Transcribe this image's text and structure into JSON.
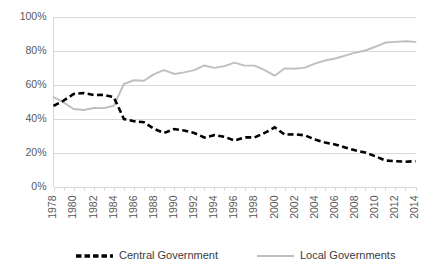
{
  "chart_data": {
    "type": "line",
    "title": "",
    "xlabel": "",
    "ylabel": "",
    "ylim": [
      0,
      100
    ],
    "xlim": [
      1978,
      2014
    ],
    "grid": true,
    "legend_position": "bottom",
    "y_ticks": [
      "0%",
      "20%",
      "40%",
      "60%",
      "80%",
      "100%"
    ],
    "y_tick_values": [
      0,
      20,
      40,
      60,
      80,
      100
    ],
    "x_tick_labels": [
      "1978",
      "1980",
      "1982",
      "1984",
      "1986",
      "1988",
      "1990",
      "1992",
      "1994",
      "1996",
      "1998",
      "2000",
      "2002",
      "2004",
      "2006",
      "2008",
      "2010",
      "2012",
      "2014"
    ],
    "x": [
      1978,
      1979,
      1980,
      1981,
      1982,
      1983,
      1984,
      1985,
      1986,
      1987,
      1988,
      1989,
      1990,
      1991,
      1992,
      1993,
      1994,
      1995,
      1996,
      1997,
      1998,
      1999,
      2000,
      2001,
      2002,
      2003,
      2004,
      2005,
      2006,
      2007,
      2008,
      2009,
      2010,
      2011,
      2012,
      2013,
      2014
    ],
    "series": [
      {
        "name": "Central Government",
        "color": "#000000",
        "style": "dashed",
        "values": [
          47.4,
          50.5,
          54.4,
          55.0,
          53.8,
          53.9,
          52.5,
          39.7,
          38.4,
          37.8,
          33.9,
          31.5,
          33.8,
          32.9,
          31.5,
          28.8,
          30.2,
          29.2,
          27.1,
          28.9,
          28.9,
          31.5,
          34.8,
          30.5,
          30.7,
          30.1,
          27.7,
          25.9,
          24.7,
          23.0,
          21.3,
          20.0,
          17.8,
          15.3,
          14.9,
          14.6,
          14.9
        ]
      },
      {
        "name": "Local Governments",
        "color": "#bfbfbf",
        "style": "solid",
        "values": [
          52.6,
          49.5,
          45.6,
          45.0,
          46.2,
          46.1,
          47.5,
          60.3,
          62.5,
          62.2,
          66.1,
          68.5,
          66.2,
          67.1,
          68.5,
          71.2,
          69.8,
          70.8,
          72.9,
          71.1,
          71.1,
          68.5,
          65.2,
          69.5,
          69.3,
          69.9,
          72.3,
          74.1,
          75.3,
          77.0,
          78.7,
          80.0,
          82.2,
          84.7,
          85.1,
          85.4,
          85.1
        ]
      }
    ],
    "legend": [
      {
        "label": "Central Government",
        "color": "#000000",
        "style": "dashed"
      },
      {
        "label": "Local Governments",
        "color": "#bfbfbf",
        "style": "solid"
      }
    ]
  },
  "colors": {
    "central": "#000000",
    "local": "#bfbfbf",
    "grid": "#d9d9d9",
    "text": "#595959",
    "background": "#ffffff"
  }
}
